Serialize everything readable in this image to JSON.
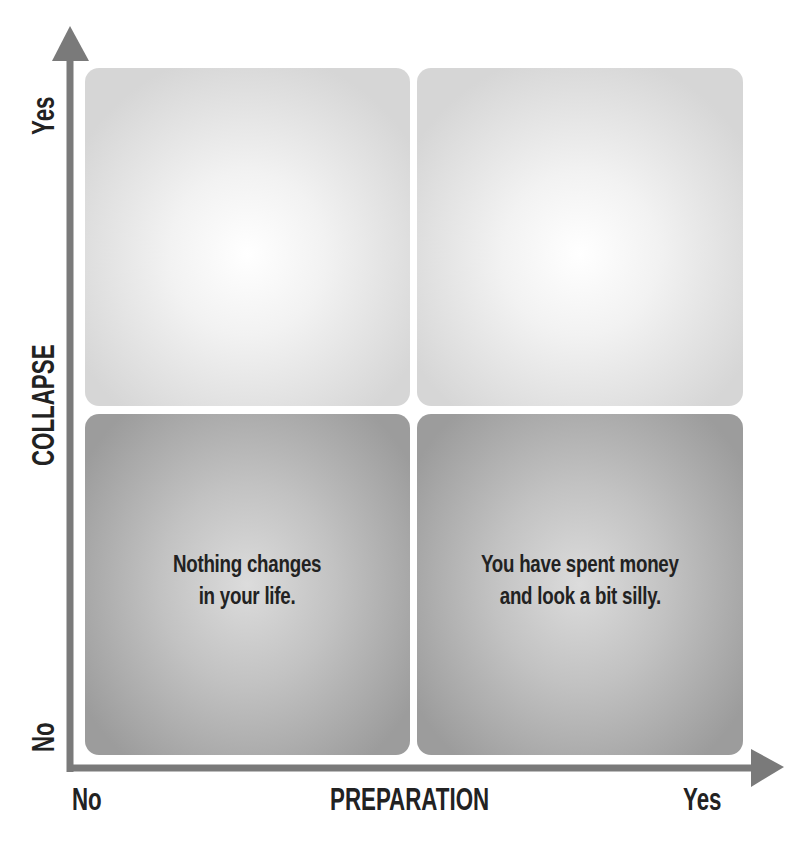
{
  "diagram": {
    "type": "2x2 matrix",
    "x_axis": {
      "title": "PREPARATION",
      "low_label": "No",
      "high_label": "Yes"
    },
    "y_axis": {
      "title": "COLLAPSE",
      "low_label": "No",
      "high_label": "Yes"
    },
    "quadrants": [
      {
        "position": "top-left",
        "x": "No",
        "y": "Yes",
        "lines": []
      },
      {
        "position": "top-right",
        "x": "Yes",
        "y": "Yes",
        "lines": []
      },
      {
        "position": "bottom-left",
        "x": "No",
        "y": "No",
        "lines": [
          "Nothing changes",
          "in your life."
        ]
      },
      {
        "position": "bottom-right",
        "x": "Yes",
        "y": "No",
        "lines": [
          "You have spent money",
          "and look a bit silly."
        ]
      }
    ],
    "colors": {
      "axis": "#7a7a7a",
      "text": "#222222",
      "top_quadrant_edge": "#d6d6d6",
      "bottom_quadrant_edge": "#9c9c9c"
    }
  }
}
